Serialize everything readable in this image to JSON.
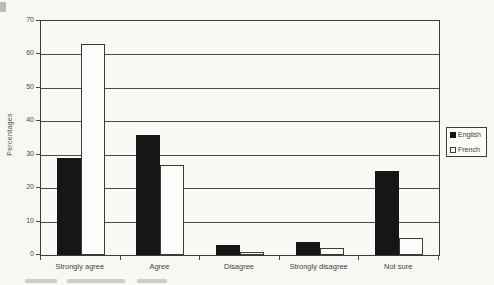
{
  "chart_data": {
    "type": "bar",
    "title": "",
    "xlabel": "",
    "ylabel": "Percentages",
    "ylim": [
      0,
      70
    ],
    "yticks": [
      0,
      10,
      20,
      30,
      40,
      50,
      60,
      70
    ],
    "grid": "horizontal",
    "legend_position": "right",
    "categories": [
      "Strongly agree",
      "Agree",
      "Disagree",
      "Strongly disagree",
      "Not sure"
    ],
    "series": [
      {
        "name": "English",
        "values": [
          29,
          36,
          3,
          4,
          25
        ],
        "fill": "#161616",
        "border": "#161616"
      },
      {
        "name": "French",
        "values": [
          63,
          27,
          1,
          2,
          5
        ],
        "fill": "#fcfcfa",
        "border": "#3a3a3a"
      }
    ]
  },
  "colors": {
    "axis_line": "#4a4a4a",
    "paper": "#f7f7f4",
    "text": "#454545"
  }
}
